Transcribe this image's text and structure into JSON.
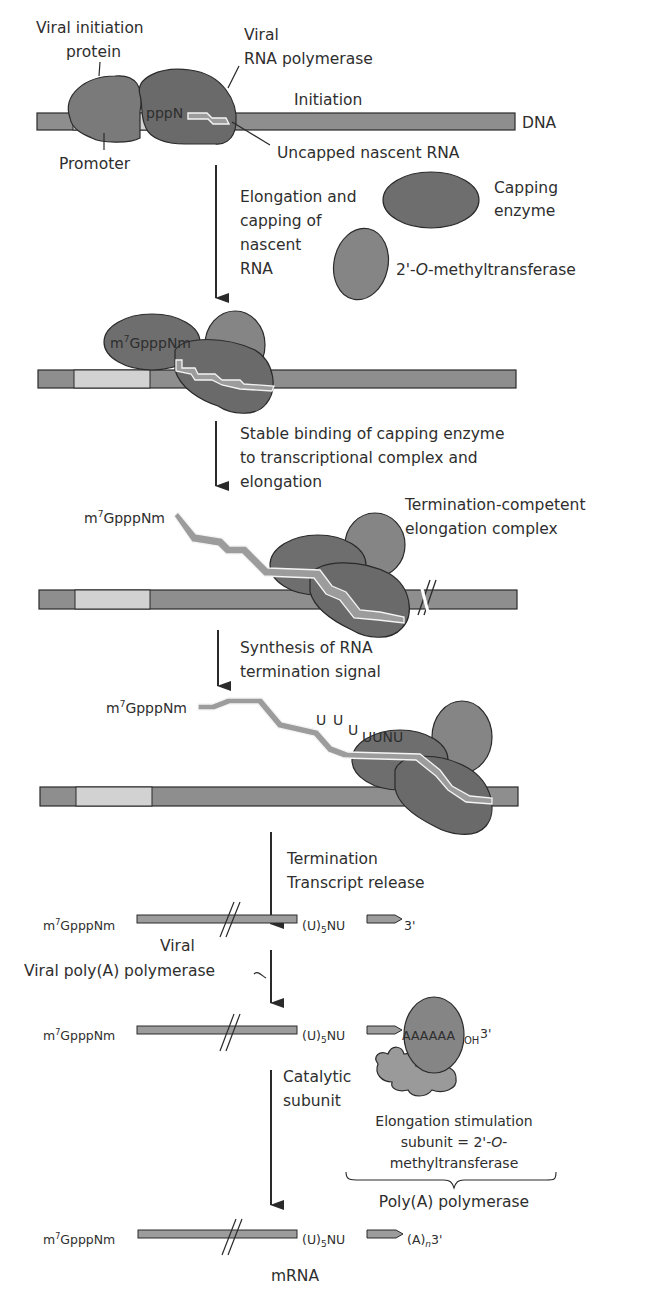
{
  "colors": {
    "background": "#ffffff",
    "text": "#2e2e2e",
    "dna_fill": "#8e8e8e",
    "promoter_fill": "#d2d2d2",
    "outline": "#2a2a2a",
    "polymerase_fill": "#6a6a6a",
    "initiation_protein_fill": "#7a7a7a",
    "capping_enzyme_fill": "#6e6e6e",
    "methyltransferase_fill": "#858585",
    "rna_fill": "#9c9c9c",
    "catalytic_subunit_fill": "#9a9a9a"
  },
  "step1": {
    "label_initiation_protein_line1": "Viral initiation",
    "label_initiation_protein_line2": "protein",
    "label_polymerase_line1": "Viral",
    "label_polymerase_line2": "RNA polymerase",
    "label_initiation": "Initiation",
    "label_dna": "DNA",
    "label_pppn": "pppN",
    "label_promoter": "Promoter",
    "label_uncapped": "Uncapped nascent RNA"
  },
  "arrow1": {
    "text_line1": "Elongation and",
    "text_line2": "capping of",
    "text_line3": "nascent",
    "text_line4": "RNA",
    "capping_enzyme_line1": "Capping",
    "capping_enzyme_line2": "enzyme",
    "methyltransferase_prefix": "2'-",
    "methyltransferase_italic": "O",
    "methyltransferase_suffix": "-methyltransferase"
  },
  "step2": {
    "cap_m": "m",
    "cap_sup": "7",
    "cap_rest": "GpppNm"
  },
  "arrow2": {
    "text_line1": "Stable binding of capping enzyme",
    "text_line2": "to transcriptional complex and",
    "text_line3": "elongation"
  },
  "step3": {
    "cap_m": "m",
    "cap_sup": "7",
    "cap_rest": "GpppNm",
    "label_line1": "Termination-competent",
    "label_line2": "elongation complex"
  },
  "arrow3": {
    "text_line1": "Synthesis of RNA",
    "text_line2": "termination signal"
  },
  "step4": {
    "cap_m": "m",
    "cap_sup": "7",
    "cap_rest": "GpppNm",
    "u1": "U",
    "u2": "U",
    "u3": "U",
    "uunu": "UUNU"
  },
  "arrow4": {
    "text_line1": "Termination",
    "text_line2": "Transcript release"
  },
  "step5": {
    "cap_m": "m",
    "cap_sup": "7",
    "cap_rest": "GpppNm",
    "label_viral": "Viral",
    "tail_u": "(U)",
    "tail_sub": "5",
    "tail_nu": "NU",
    "end_3": "3'"
  },
  "arrow5": {
    "text": "Viral poly(A) polymerase"
  },
  "step6": {
    "cap_m": "m",
    "cap_sup": "7",
    "cap_rest": "GpppNm",
    "tail_u": "(U)",
    "tail_sub": "5",
    "tail_nu": "NU",
    "polya": "AAAAAA",
    "oh": "OH",
    "end_3": "3'"
  },
  "arrow6": {
    "catalytic_line1": "Catalytic",
    "catalytic_line2": "subunit",
    "stim_line1": "Elongation stimulation",
    "stim_line2_prefix": "subunit = 2'-",
    "stim_line2_italic": "O",
    "stim_line2_suffix": "-",
    "stim_line3": "methyltransferase",
    "polya_polymerase": "Poly(A) polymerase"
  },
  "step7": {
    "cap_m": "m",
    "cap_sup": "7",
    "cap_rest": "GpppNm",
    "tail_u": "(U)",
    "tail_sub": "5",
    "tail_nu": "NU",
    "polya_a": "(A)",
    "polya_n": "n",
    "end_3": "3'",
    "label_mrna": "mRNA"
  }
}
